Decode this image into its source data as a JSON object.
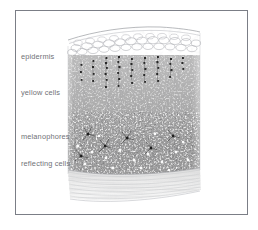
{
  "figure": {
    "style": "grayscale pen-and-ink stipple illustration",
    "frame_color": "#7b7e86",
    "background_color": "#ffffff",
    "label_color": "#6f7176"
  },
  "labels": [
    {
      "id": "epidermis",
      "text": "epidermis",
      "x": 21,
      "y": 53
    },
    {
      "id": "yellow-cells",
      "text": "yellow cells",
      "x": 21,
      "y": 89
    },
    {
      "id": "melanophores",
      "text": "melanophores",
      "x": 21,
      "y": 133
    },
    {
      "id": "reflecting-cells",
      "text": "reflecting cells",
      "x": 21,
      "y": 160
    }
  ],
  "layers": [
    {
      "name": "epidermis",
      "description": "thin surface band of rounded outlined polygonal cells",
      "top": 28,
      "bottom": 54,
      "tone": "#ffffff"
    },
    {
      "name": "yellow cells",
      "description": "dense stippled dermal band with pale round xanthophores and vertical dark pigment chains",
      "top": 54,
      "bottom": 118,
      "tone": "#9a9a9a"
    },
    {
      "name": "melanophores",
      "description": "darkest stippled band with branched black pigment cells and bright white iridophore dots",
      "top": 118,
      "bottom": 170,
      "tone": "#6e6e6e"
    },
    {
      "name": "reflecting cells",
      "description": "pale layer of fine horizontal wavy striations at the base",
      "top": 170,
      "bottom": 202,
      "tone": "#e4e4e4"
    }
  ],
  "block": {
    "left": 68,
    "right": 200,
    "top": 28,
    "bottom": 202
  }
}
